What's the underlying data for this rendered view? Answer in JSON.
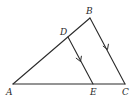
{
  "diagram": {
    "type": "geometry-triangle",
    "points": {
      "A": {
        "x": 13,
        "y": 84
      },
      "B": {
        "x": 90,
        "y": 18
      },
      "C": {
        "x": 125,
        "y": 84
      },
      "D": {
        "x": 68,
        "y": 37
      },
      "E": {
        "x": 93,
        "y": 84
      }
    },
    "labels": {
      "A": "A",
      "B": "B",
      "C": "C",
      "D": "D",
      "E": "E"
    },
    "segments": [
      {
        "from": "A",
        "to": "B"
      },
      {
        "from": "B",
        "to": "C"
      },
      {
        "from": "A",
        "to": "C"
      },
      {
        "from": "D",
        "to": "E"
      }
    ],
    "parallel_marks": [
      {
        "segment": "DE",
        "marker": "single-arrow"
      },
      {
        "segment": "BC",
        "marker": "single-arrow"
      }
    ],
    "colors": {
      "stroke": "#2b2b2b",
      "background": "#ffffff"
    }
  }
}
